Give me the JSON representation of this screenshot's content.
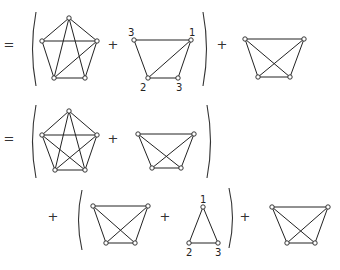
{
  "rows": [
    {
      "operators": [
        {
          "sym": "=",
          "x": 9,
          "y": 45
        },
        {
          "sym": "+",
          "x": 113,
          "y": 45
        },
        {
          "sym": "+",
          "x": 222,
          "y": 45
        }
      ],
      "parens": [
        {
          "side": "left",
          "x": 36,
          "y1": 12,
          "y2": 86
        },
        {
          "side": "right",
          "x": 203,
          "y1": 12,
          "y2": 86
        }
      ],
      "graphs": [
        {
          "name": "pentagon-graph-9-edges",
          "vertices": [
            [
              69,
              18
            ],
            [
              42,
              41
            ],
            [
              97,
              41
            ],
            [
              54,
              78
            ],
            [
              85,
              78
            ]
          ],
          "edges": [
            [
              0,
              1
            ],
            [
              0,
              2
            ],
            [
              1,
              2
            ],
            [
              1,
              3
            ],
            [
              2,
              4
            ],
            [
              3,
              4
            ],
            [
              0,
              3
            ],
            [
              0,
              4
            ],
            [
              3,
              2
            ]
          ],
          "labels": []
        },
        {
          "name": "trapezoid-graph-labeled",
          "vertices": [
            [
              134,
              40
            ],
            [
              191,
              40
            ],
            [
              148,
              78
            ],
            [
              178,
              78
            ]
          ],
          "edges": [
            [
              0,
              1
            ],
            [
              0,
              2
            ],
            [
              1,
              3
            ],
            [
              2,
              3
            ],
            [
              2,
              1
            ]
          ],
          "labels": [
            {
              "text": "3",
              "x": 128,
              "y": 36
            },
            {
              "text": "1",
              "x": 189,
              "y": 36
            },
            {
              "text": "2",
              "x": 140,
              "y": 91
            },
            {
              "text": "3",
              "x": 176,
              "y": 91
            }
          ]
        },
        {
          "name": "trapezoid-complete-graph",
          "vertices": [
            [
              245,
              39
            ],
            [
              304,
              39
            ],
            [
              258,
              77
            ],
            [
              290,
              77
            ]
          ],
          "edges": [
            [
              0,
              1
            ],
            [
              0,
              2
            ],
            [
              1,
              3
            ],
            [
              2,
              3
            ],
            [
              0,
              3
            ],
            [
              1,
              2
            ]
          ],
          "labels": []
        }
      ]
    },
    {
      "operators": [
        {
          "sym": "=",
          "x": 9,
          "y": 139
        },
        {
          "sym": "+",
          "x": 113,
          "y": 139
        }
      ],
      "parens": [
        {
          "side": "left",
          "x": 36,
          "y1": 105,
          "y2": 178
        },
        {
          "side": "right",
          "x": 207,
          "y1": 105,
          "y2": 178
        }
      ],
      "graphs": [
        {
          "name": "pentagon-complete-graph",
          "vertices": [
            [
              69,
              111
            ],
            [
              42,
              135
            ],
            [
              97,
              135
            ],
            [
              55,
              170
            ],
            [
              85,
              170
            ]
          ],
          "edges": [
            [
              0,
              1
            ],
            [
              0,
              2
            ],
            [
              1,
              2
            ],
            [
              1,
              3
            ],
            [
              2,
              4
            ],
            [
              3,
              4
            ],
            [
              0,
              3
            ],
            [
              0,
              4
            ],
            [
              1,
              4
            ],
            [
              2,
              3
            ]
          ],
          "labels": []
        },
        {
          "name": "trapezoid-complete-graph",
          "vertices": [
            [
              138,
              134
            ],
            [
              194,
              134
            ],
            [
              152,
              168
            ],
            [
              181,
              168
            ]
          ],
          "edges": [
            [
              0,
              1
            ],
            [
              0,
              2
            ],
            [
              1,
              3
            ],
            [
              2,
              3
            ],
            [
              0,
              3
            ],
            [
              1,
              2
            ]
          ],
          "labels": []
        }
      ]
    },
    {
      "operators": [
        {
          "sym": "+",
          "x": 53,
          "y": 217
        },
        {
          "sym": "+",
          "x": 165,
          "y": 217
        },
        {
          "sym": "+",
          "x": 245,
          "y": 217
        }
      ],
      "parens": [
        {
          "side": "left",
          "x": 82,
          "y1": 190,
          "y2": 250
        },
        {
          "side": "right",
          "x": 229,
          "y1": 188,
          "y2": 248
        }
      ],
      "graphs": [
        {
          "name": "trapezoid-complete-graph",
          "vertices": [
            [
              93,
              206
            ],
            [
              148,
              206
            ],
            [
              106,
              243
            ],
            [
              135,
              243
            ]
          ],
          "edges": [
            [
              0,
              1
            ],
            [
              0,
              2
            ],
            [
              1,
              3
            ],
            [
              2,
              3
            ],
            [
              0,
              3
            ],
            [
              1,
              2
            ]
          ],
          "labels": []
        },
        {
          "name": "triangle-graph-labeled",
          "vertices": [
            [
              203,
              207
            ],
            [
              189,
              243
            ],
            [
              218,
              243
            ]
          ],
          "edges": [
            [
              0,
              1
            ],
            [
              0,
              2
            ],
            [
              1,
              2
            ]
          ],
          "labels": [
            {
              "text": "1",
              "x": 200,
              "y": 203
            },
            {
              "text": "2",
              "x": 186,
              "y": 256
            },
            {
              "text": "3",
              "x": 215,
              "y": 256
            }
          ]
        },
        {
          "name": "trapezoid-complete-graph",
          "vertices": [
            [
              272,
              207
            ],
            [
              328,
              207
            ],
            [
              287,
              243
            ],
            [
              315,
              243
            ]
          ],
          "edges": [
            [
              0,
              1
            ],
            [
              0,
              2
            ],
            [
              1,
              3
            ],
            [
              2,
              3
            ],
            [
              0,
              3
            ],
            [
              1,
              2
            ]
          ],
          "labels": []
        }
      ]
    }
  ]
}
